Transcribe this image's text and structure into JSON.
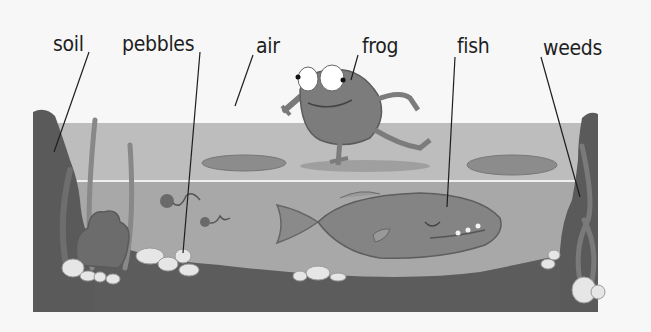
{
  "diagram": {
    "title": "",
    "labels": [
      {
        "id": "soil",
        "text": "soil"
      },
      {
        "id": "pebbles",
        "text": "pebbles"
      },
      {
        "id": "air",
        "text": "air"
      },
      {
        "id": "frog",
        "text": "frog"
      },
      {
        "id": "fish",
        "text": "fish"
      },
      {
        "id": "weeds",
        "text": "weeds"
      }
    ],
    "colors": {
      "background": "#f7f7f7",
      "air_band": "#bdbdbd",
      "water": "#a9a9a9",
      "soil": "#5e5e5e",
      "pebble": "#e8e8e8",
      "creature": "#7d7d7d",
      "leader_line": "#1e1e1e"
    }
  }
}
